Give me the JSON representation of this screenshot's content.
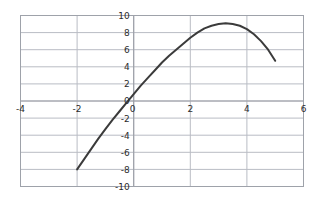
{
  "chart_data": {
    "type": "line",
    "title": "",
    "subtitle": "",
    "xlabel": "",
    "ylabel": "",
    "xlim": [
      -4,
      6
    ],
    "ylim": [
      -10,
      10
    ],
    "grid": true,
    "legend": "none",
    "xticks": [
      "-4",
      "-2",
      "0",
      "2",
      "4",
      "6"
    ],
    "xtick_values": [
      -4,
      -2,
      0,
      2,
      4,
      6
    ],
    "yticks": [
      "10",
      "8",
      "6",
      "4",
      "2",
      "0",
      "-2",
      "-4",
      "-6",
      "-8",
      "-10"
    ],
    "ytick_values": [
      10,
      8,
      6,
      4,
      2,
      0,
      -2,
      -4,
      -6,
      -8,
      -10
    ],
    "gridlines_x": [
      -4,
      -2,
      0,
      2,
      4,
      6
    ],
    "gridlines_y": [
      10,
      8,
      6,
      4,
      2,
      0,
      -2,
      -4,
      -6,
      -8,
      -10
    ],
    "series": [
      {
        "name": "parabola",
        "color": "#3b3b3b",
        "linewidth": 2,
        "description": "downward-opening parabola, vertex near (2, 9)",
        "x": [
          -2.0,
          -1.75,
          -1.5,
          -1.25,
          -1.0,
          -0.75,
          -0.5,
          -0.25,
          0.0,
          0.25,
          0.5,
          0.75,
          1.0,
          1.25,
          1.5,
          1.75,
          2.0,
          2.25,
          2.5,
          2.75,
          3.0,
          3.25,
          3.5,
          3.75,
          4.0,
          4.25,
          4.5,
          4.75,
          5.0
        ],
        "y": [
          -8.0,
          -6.8,
          -5.6,
          -4.4,
          -3.3,
          -2.2,
          -1.2,
          -0.2,
          0.8,
          1.8,
          2.7,
          3.6,
          4.5,
          5.3,
          6.0,
          6.7,
          7.4,
          8.0,
          8.5,
          8.8,
          9.0,
          9.1,
          9.0,
          8.8,
          8.4,
          7.8,
          7.0,
          6.0,
          4.7
        ]
      }
    ],
    "curve_points": {
      "left_endpoint": [
        -2,
        -8
      ],
      "y_intercept": [
        0,
        4
      ],
      "vertex": [
        2,
        9
      ],
      "right_endpoint": [
        5,
        0
      ]
    },
    "colors": {
      "curve": "#3b3b3b",
      "grid": "#b9bcc4",
      "border": "#9ea2aa",
      "axis": "#9b9ea6",
      "text": "#2b2b2b",
      "background": "#ffffff"
    }
  },
  "labels": {
    "x": [
      {
        "text": "-4",
        "value": -4
      },
      {
        "text": "-2",
        "value": -2
      },
      {
        "text": "0",
        "value": 0
      },
      {
        "text": "2",
        "value": 2
      },
      {
        "text": "4",
        "value": 4
      },
      {
        "text": "6",
        "value": 6
      }
    ],
    "y": [
      {
        "text": "10",
        "value": 10
      },
      {
        "text": "8",
        "value": 8
      },
      {
        "text": "6",
        "value": 6
      },
      {
        "text": "4",
        "value": 4
      },
      {
        "text": "2",
        "value": 2
      },
      {
        "text": "0",
        "value": 0
      },
      {
        "text": "-2",
        "value": -2
      },
      {
        "text": "-4",
        "value": -4
      },
      {
        "text": "-6",
        "value": -6
      },
      {
        "text": "-8",
        "value": -8
      },
      {
        "text": "-10",
        "value": -10
      }
    ]
  }
}
